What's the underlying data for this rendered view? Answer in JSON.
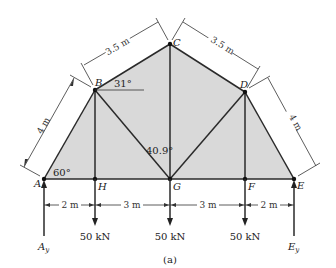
{
  "diagram": {
    "caption": "(a)",
    "colors": {
      "fill": "#d9d9d9",
      "member": "#2a2a2a",
      "background": "#ffffff"
    },
    "nodes": [
      {
        "id": "A",
        "label": "A",
        "x": 44,
        "y": 179
      },
      {
        "id": "H",
        "label": "H",
        "x": 95,
        "y": 179
      },
      {
        "id": "G",
        "label": "G",
        "x": 170,
        "y": 179
      },
      {
        "id": "F",
        "label": "F",
        "x": 245,
        "y": 179
      },
      {
        "id": "E",
        "label": "E",
        "x": 294,
        "y": 179
      },
      {
        "id": "B",
        "label": "B",
        "x": 95,
        "y": 90
      },
      {
        "id": "C",
        "label": "C",
        "x": 170,
        "y": 44
      },
      {
        "id": "D",
        "label": "D",
        "x": 245,
        "y": 92
      }
    ],
    "members": [
      "AB",
      "BC",
      "CD",
      "DE",
      "AH",
      "HG",
      "GF",
      "FE",
      "BH",
      "BG",
      "CG",
      "DG",
      "DF"
    ],
    "angles": {
      "A": "60°",
      "B": "31°",
      "G": "40.9°"
    },
    "dimensions": {
      "AB": "4 m",
      "BC": "3.5 m",
      "CD": "3.5 m",
      "DE": "4 m",
      "AH": "2 m",
      "HG": "3 m",
      "GF": "3 m",
      "FE": "2 m"
    },
    "loads": [
      {
        "at": "H",
        "label": "50 kN"
      },
      {
        "at": "G",
        "label": "50 kN"
      },
      {
        "at": "F",
        "label": "50 kN"
      }
    ],
    "reactions": {
      "A": "A",
      "A_sub": "y",
      "E": "E",
      "E_sub": "y"
    }
  }
}
